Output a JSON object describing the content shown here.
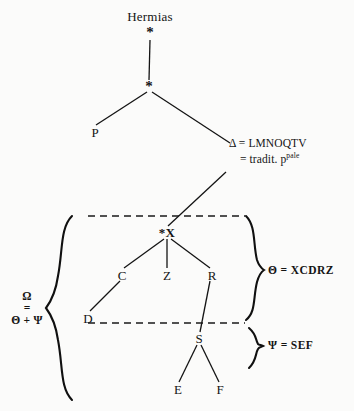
{
  "diagram": {
    "type": "stemma-codicum",
    "title_node": "Hermias",
    "nodes": [
      {
        "id": "hermias",
        "label": "Hermias",
        "x": 150,
        "y": 16,
        "kind": "name"
      },
      {
        "id": "arch1",
        "label": "*",
        "x": 150,
        "y": 31,
        "kind": "star"
      },
      {
        "id": "arch2",
        "label": "*",
        "x": 149,
        "y": 86,
        "kind": "star"
      },
      {
        "id": "P",
        "label": "P",
        "x": 95,
        "y": 132,
        "kind": "witness"
      },
      {
        "id": "starX",
        "label": "*X",
        "x": 167,
        "y": 232,
        "kind": "star-named"
      },
      {
        "id": "C",
        "label": "C",
        "x": 122,
        "y": 275,
        "kind": "witness"
      },
      {
        "id": "Z",
        "label": "Z",
        "x": 167,
        "y": 275,
        "kind": "witness"
      },
      {
        "id": "R",
        "label": "R",
        "x": 212,
        "y": 275,
        "kind": "witness"
      },
      {
        "id": "D",
        "label": "D",
        "x": 88,
        "y": 318,
        "kind": "witness"
      },
      {
        "id": "S",
        "label": "S",
        "x": 199,
        "y": 338,
        "kind": "witness"
      },
      {
        "id": "E",
        "label": "E",
        "x": 178,
        "y": 389,
        "kind": "witness"
      },
      {
        "id": "F",
        "label": "F",
        "x": 220,
        "y": 389,
        "kind": "witness"
      }
    ],
    "delta": {
      "line1": "Δ = LMNOQTV",
      "line2_prefix": "= tradit. p",
      "line2_sup": "pale"
    },
    "groups": [
      {
        "id": "theta",
        "label": "Θ = XCDRZ",
        "x": 268,
        "y": 270
      },
      {
        "id": "psi",
        "label": "Ψ = SEF",
        "x": 268,
        "y": 345
      }
    ],
    "omega": {
      "line1": "Ω",
      "line2": "=",
      "line3": "Θ + Ψ",
      "x": 26,
      "y": 310
    },
    "braces": {
      "left_big": "{",
      "right_theta": "}",
      "right_psi": "}"
    },
    "dashed_rules": [
      {
        "id": "upper-dashed",
        "x1": 88,
        "x2": 245,
        "y": 216
      },
      {
        "id": "lower-dashed",
        "x1": 88,
        "x2": 245,
        "y": 323
      }
    ],
    "colors": {
      "ink": "#141414",
      "paper": "#fbfbfa",
      "rule": "#1a1a1a"
    }
  }
}
